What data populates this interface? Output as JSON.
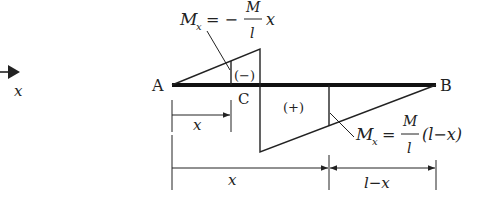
{
  "diagram": {
    "axis_label": "x",
    "points": {
      "A": "A",
      "B": "B",
      "C": "C"
    },
    "regions": {
      "negative": "(−)",
      "positive": "(+)"
    },
    "formula_left": {
      "lhs": "M",
      "sub": "x",
      "eq": "= −",
      "num": "M",
      "den": "l",
      "tail": "x"
    },
    "formula_right": {
      "lhs": "M",
      "sub": "x",
      "eq": "=",
      "num": "M",
      "den": "l",
      "tail": "(l−x)"
    },
    "dimensions": {
      "short_x": "x",
      "long_x": "x",
      "remainder": "l−x"
    },
    "colors": {
      "line": "#222222",
      "beam": "#111111"
    }
  }
}
